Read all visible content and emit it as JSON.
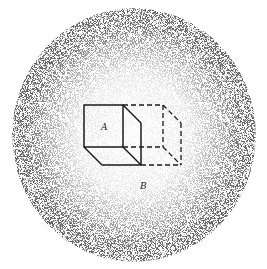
{
  "figure": {
    "labels": {
      "a": "A",
      "b": "B"
    },
    "colors": {
      "background": "#ffffff",
      "ink": "#1a1a1a",
      "stipple": "#2a2a2a"
    },
    "field": {
      "cx": 134,
      "cy": 135,
      "rx": 122,
      "ry": 127
    },
    "solid_cube": {
      "front": [
        [
          84,
          105
        ],
        [
          123,
          105
        ],
        [
          123,
          147
        ],
        [
          84,
          147
        ]
      ],
      "depth_offset": [
        18,
        18
      ]
    },
    "dashed_cube": {
      "front_right_x": 163,
      "back_right_x": 181
    }
  }
}
